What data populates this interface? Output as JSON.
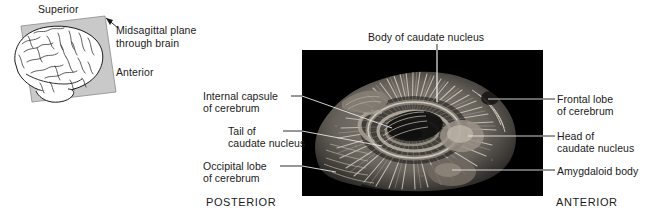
{
  "figure": {
    "title_hidden": "",
    "background_color": "#ffffff",
    "photo_background_color": "#000000",
    "text_color": "#1a1a1a",
    "plane_fill_color": "#c9c9c9"
  },
  "inset": {
    "name": "orientation-inset",
    "labels": {
      "superior": "Superior",
      "midsagittal_line1": "Midsagittal plane",
      "midsagittal_line2": "through brain",
      "anterior": "Anterior"
    }
  },
  "photo": {
    "name": "brain-dissection-photograph",
    "description_hidden": ""
  },
  "callouts": [
    {
      "id": "body-of-caudate-nucleus",
      "line1": "Body of caudate nucleus",
      "line2": "",
      "side": "top"
    },
    {
      "id": "internal-capsule-of-cerebrum",
      "line1": "Internal capsule",
      "line2": "of cerebrum",
      "side": "left"
    },
    {
      "id": "tail-of-caudate-nucleus",
      "line1": "Tail of",
      "line2": "caudate nucleus",
      "side": "left"
    },
    {
      "id": "occipital-lobe-of-cerebrum",
      "line1": "Occipital lobe",
      "line2": "of cerebrum",
      "side": "left"
    },
    {
      "id": "frontal-lobe-of-cerebrum",
      "line1": "Frontal lobe",
      "line2": "of cerebrum",
      "side": "right"
    },
    {
      "id": "head-of-caudate-nucleus",
      "line1": "Head of",
      "line2": "caudate nucleus",
      "side": "right"
    },
    {
      "id": "amygdaloid-body",
      "line1": "Amygdaloid body",
      "line2": "",
      "side": "right"
    }
  ],
  "orientation": {
    "posterior": "POSTERIOR",
    "anterior": "ANTERIOR"
  }
}
